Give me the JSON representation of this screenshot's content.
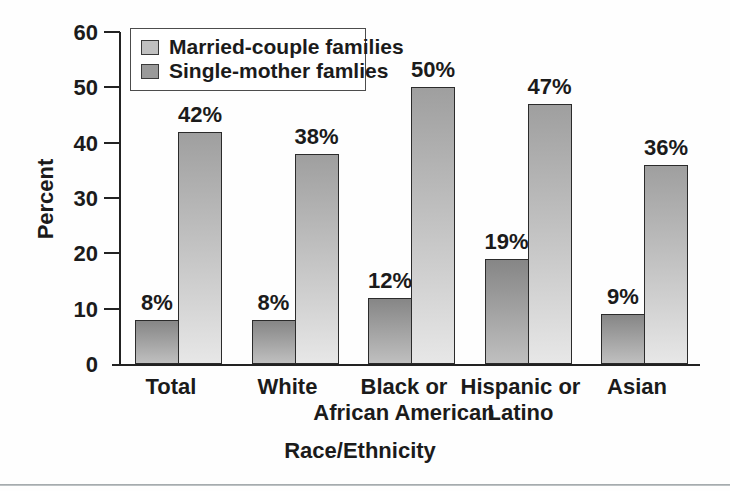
{
  "figure": {
    "ylabel": "Percent",
    "xlabel": "Race/Ethnicity",
    "axis_color": "#222222",
    "text_color": "#1b1b1b",
    "bottom_rule_color": "#9aa0a3"
  },
  "legend": {
    "items": [
      {
        "label": "Married-couple families",
        "swatch_color": "#c0c0c0"
      },
      {
        "label": "Single-mother famlies",
        "swatch_color": "#9a9a9a"
      }
    ]
  },
  "chart_data": {
    "type": "bar",
    "title": "",
    "xlabel": "Race/Ethnicity",
    "ylabel": "Percent",
    "ylim": [
      0,
      60
    ],
    "yticks": [
      0,
      10,
      20,
      30,
      40,
      50,
      60
    ],
    "grid": false,
    "legend_position": "upper-left-inside",
    "categories": [
      "Total",
      "White",
      "Black or African American",
      "Hispanic or Latino",
      "Asian"
    ],
    "category_lines": [
      [
        "Total"
      ],
      [
        "White"
      ],
      [
        "Black or",
        "African American"
      ],
      [
        "Hispanic or",
        "Latino"
      ],
      [
        "Asian"
      ]
    ],
    "series": [
      {
        "name": "Married-couple families",
        "values": [
          8,
          8,
          12,
          19,
          9
        ],
        "value_labels": [
          "8%",
          "8%",
          "12%",
          "19%",
          "9%"
        ],
        "bar_top_color": "#868686",
        "bar_bottom_color": "#bfbfbf"
      },
      {
        "name": "Single-mother famlies",
        "values": [
          42,
          38,
          50,
          47,
          36
        ],
        "value_labels": [
          "42%",
          "38%",
          "50%",
          "47%",
          "36%"
        ],
        "bar_top_color": "#9f9f9f",
        "bar_bottom_color": "#e7e7e7"
      }
    ]
  }
}
